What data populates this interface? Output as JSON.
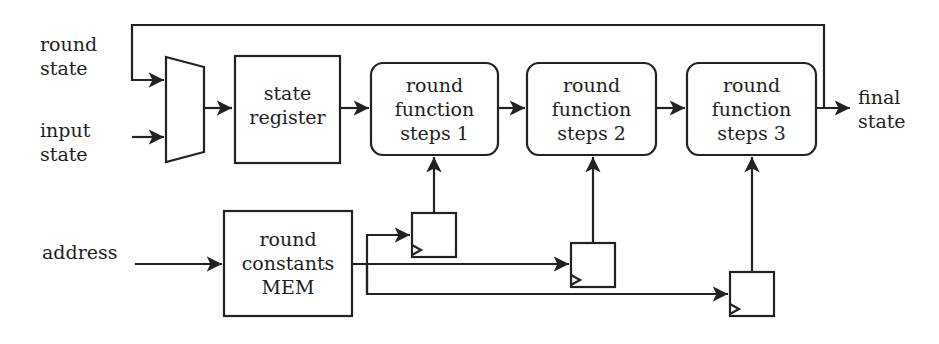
{
  "diagram": {
    "type": "block-diagram",
    "inputs": {
      "round_state": {
        "line1": "round",
        "line2": "state"
      },
      "input_state": {
        "line1": "input",
        "line2": "state"
      },
      "address": {
        "label": "address"
      }
    },
    "output": {
      "line1": "final",
      "line2": "state"
    },
    "blocks": {
      "mux": {
        "label": ""
      },
      "state_register": {
        "line1": "state",
        "line2": "register"
      },
      "round_function_1": {
        "line1": "round",
        "line2": "function",
        "line3": "steps 1"
      },
      "round_function_2": {
        "line1": "round",
        "line2": "function",
        "line3": "steps 2"
      },
      "round_function_3": {
        "line1": "round",
        "line2": "function",
        "line3": "steps 3"
      },
      "round_constants_mem": {
        "line1": "round",
        "line2": "constants",
        "line3": "MEM"
      }
    },
    "flip_flops": [
      "FF1",
      "FF2",
      "FF3"
    ],
    "edges": [
      [
        "round state",
        "mux"
      ],
      [
        "input state",
        "mux"
      ],
      [
        "mux",
        "state register"
      ],
      [
        "state register",
        "round function steps 1"
      ],
      [
        "round function steps 1",
        "round function steps 2"
      ],
      [
        "round function steps 2",
        "round function steps 3"
      ],
      [
        "round function steps 3",
        "final state"
      ],
      [
        "round function steps 3",
        "mux (feedback)"
      ],
      [
        "address",
        "round constants MEM"
      ],
      [
        "round constants MEM",
        "FF1"
      ],
      [
        "round constants MEM",
        "FF2"
      ],
      [
        "round constants MEM",
        "FF3"
      ],
      [
        "FF1",
        "round function steps 1"
      ],
      [
        "FF2",
        "round function steps 2"
      ],
      [
        "FF3",
        "round function steps 3"
      ]
    ]
  }
}
